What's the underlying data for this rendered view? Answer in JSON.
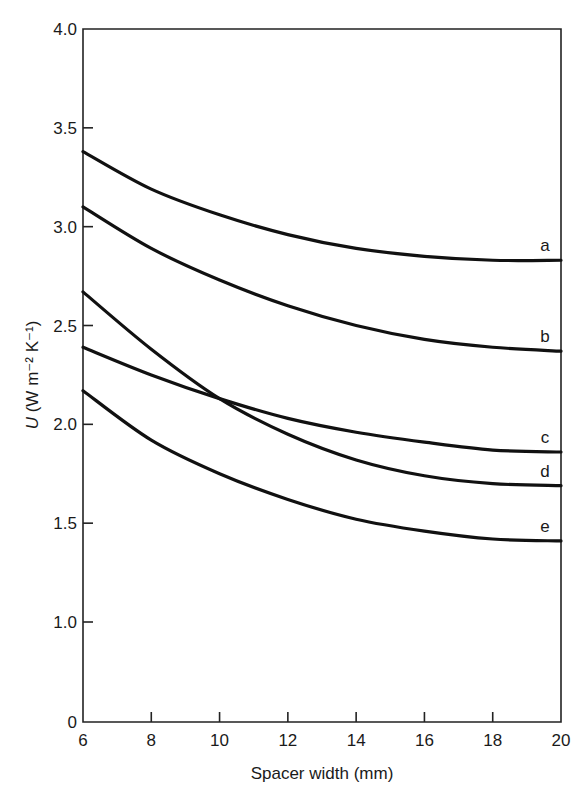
{
  "chart_data": {
    "type": "line",
    "title": "",
    "xlabel": "Spacer width (mm)",
    "ylabel": "U (W m⁻² K⁻¹)",
    "xlim": [
      6,
      20
    ],
    "ylim": [
      0,
      4.0
    ],
    "y_axis_break": "axis jumps from 0 to 1.0",
    "grid": false,
    "legend": "inline curve labels at right end",
    "x_ticks": [
      6,
      8,
      10,
      12,
      14,
      16,
      18,
      20
    ],
    "x_tick_labels": [
      "6",
      "8",
      "10",
      "12",
      "14",
      "16",
      "18",
      "20"
    ],
    "y_ticks": [
      0,
      1.0,
      1.5,
      2.0,
      2.5,
      3.0,
      3.5,
      4.0
    ],
    "y_tick_labels": [
      "0",
      "1.0",
      "1.5",
      "2.0",
      "2.5",
      "3.0",
      "3.5",
      "4.0"
    ],
    "x": [
      6,
      8,
      10,
      12,
      14,
      16,
      18,
      20
    ],
    "series": [
      {
        "name": "a",
        "values": [
          3.38,
          3.19,
          3.06,
          2.96,
          2.89,
          2.85,
          2.83,
          2.83
        ]
      },
      {
        "name": "b",
        "values": [
          3.1,
          2.89,
          2.73,
          2.6,
          2.5,
          2.43,
          2.39,
          2.37
        ]
      },
      {
        "name": "c",
        "values": [
          2.39,
          2.25,
          2.13,
          2.03,
          1.96,
          1.91,
          1.87,
          1.86
        ]
      },
      {
        "name": "d",
        "values": [
          2.67,
          2.38,
          2.13,
          1.95,
          1.82,
          1.74,
          1.7,
          1.69
        ]
      },
      {
        "name": "e",
        "values": [
          2.17,
          1.92,
          1.75,
          1.62,
          1.52,
          1.46,
          1.42,
          1.41
        ]
      }
    ]
  }
}
